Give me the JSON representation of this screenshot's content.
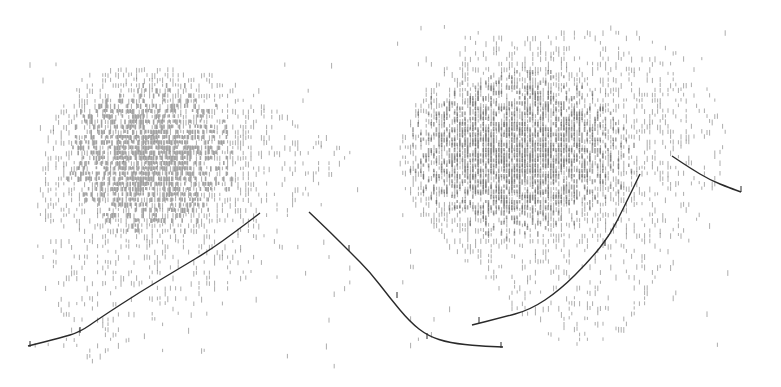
{
  "figure": {
    "width": 781,
    "height": 387,
    "background": "#ffffff",
    "ink_color": "#2a2a2a",
    "mark_color": "#555555"
  },
  "blobs": [
    {
      "name": "left-density-cluster",
      "cx": 165,
      "cy": 175,
      "rx": 125,
      "ry": 110,
      "core_cx": 150,
      "core_cy": 155,
      "core_rx": 60,
      "core_ry": 45,
      "top": 62,
      "bottom": 365,
      "left": 30,
      "right": 360,
      "outline": [
        [
          120,
          62
        ],
        [
          170,
          65
        ],
        [
          230,
          75
        ],
        [
          270,
          95
        ],
        [
          300,
          125
        ],
        [
          340,
          135
        ],
        [
          355,
          150
        ],
        [
          330,
          175
        ],
        [
          300,
          205
        ],
        [
          280,
          250
        ],
        [
          240,
          280
        ],
        [
          200,
          300
        ],
        [
          150,
          330
        ],
        [
          110,
          355
        ],
        [
          80,
          362
        ],
        [
          60,
          340
        ],
        [
          45,
          300
        ],
        [
          35,
          250
        ],
        [
          40,
          180
        ],
        [
          50,
          120
        ],
        [
          75,
          85
        ]
      ]
    },
    {
      "name": "right-density-cluster",
      "cx": 565,
      "cy": 175,
      "rx": 160,
      "ry": 125,
      "core_cx": 520,
      "core_cy": 150,
      "core_rx": 80,
      "core_ry": 50,
      "top": 25,
      "bottom": 345,
      "left": 395,
      "right": 730,
      "outline": [
        [
          470,
          28
        ],
        [
          540,
          25
        ],
        [
          640,
          30
        ],
        [
          690,
          55
        ],
        [
          715,
          90
        ],
        [
          728,
          130
        ],
        [
          720,
          175
        ],
        [
          700,
          215
        ],
        [
          670,
          245
        ],
        [
          650,
          285
        ],
        [
          640,
          320
        ],
        [
          600,
          340
        ],
        [
          560,
          340
        ],
        [
          530,
          320
        ],
        [
          500,
          290
        ],
        [
          460,
          255
        ],
        [
          430,
          225
        ],
        [
          405,
          190
        ],
        [
          398,
          150
        ],
        [
          410,
          110
        ],
        [
          430,
          80
        ],
        [
          455,
          55
        ]
      ]
    }
  ],
  "curves": [
    {
      "name": "left-rising-curve",
      "points": [
        [
          28,
          346
        ],
        [
          60,
          338
        ],
        [
          80,
          332
        ],
        [
          100,
          318
        ],
        [
          140,
          292
        ],
        [
          180,
          268
        ],
        [
          210,
          250
        ],
        [
          235,
          232
        ],
        [
          260,
          213
        ]
      ],
      "ticks": [
        [
          30,
          346
        ],
        [
          80,
          332
        ]
      ]
    },
    {
      "name": "center-descending-curve",
      "points": [
        [
          309,
          212
        ],
        [
          330,
          232
        ],
        [
          350,
          252
        ],
        [
          370,
          272
        ],
        [
          390,
          298
        ],
        [
          410,
          322
        ],
        [
          428,
          336
        ],
        [
          450,
          343
        ],
        [
          480,
          346
        ],
        [
          503,
          347
        ]
      ],
      "ticks": [
        [
          349,
          250
        ],
        [
          397,
          297
        ],
        [
          427,
          338
        ],
        [
          501,
          347
        ]
      ]
    },
    {
      "name": "right-rising-curve",
      "points": [
        [
          472,
          325
        ],
        [
          500,
          318
        ],
        [
          530,
          310
        ],
        [
          560,
          290
        ],
        [
          590,
          260
        ],
        [
          610,
          235
        ],
        [
          625,
          205
        ],
        [
          640,
          174
        ]
      ],
      "ticks": [
        [
          479,
          322
        ],
        [
          605,
          245
        ]
      ]
    },
    {
      "name": "right-short-curve",
      "points": [
        [
          672,
          156
        ],
        [
          690,
          168
        ],
        [
          710,
          180
        ],
        [
          730,
          188
        ],
        [
          741,
          192
        ]
      ],
      "ticks": [
        [
          741,
          191
        ]
      ]
    }
  ],
  "seed": 1337
}
